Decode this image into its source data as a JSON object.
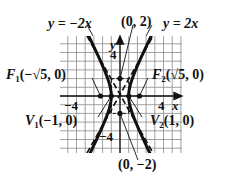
{
  "diagram": {
    "type": "hyperbola-graph",
    "equation_implied": "x^2 - y^2/4 = 1",
    "labels": {
      "asymptote_left": "y = −2x",
      "asymptote_right": "y = 2x",
      "covertex_top": "(0, 2)",
      "covertex_bottom": "(0, −2)",
      "focus_left_name": "F",
      "focus_left_sub": "1",
      "focus_left_coords": "(−√5, 0)",
      "focus_right_name": "F",
      "focus_right_sub": "2",
      "focus_right_coords": "(√5, 0)",
      "vertex_left_name": "V",
      "vertex_left_sub": "1",
      "vertex_left_coords": "(−1, 0)",
      "vertex_right_name": "V",
      "vertex_right_sub": "2",
      "vertex_right_coords": "(1, 0)"
    },
    "axes": {
      "x_label": "x",
      "y_label": "y",
      "tick_x_neg": "−4",
      "tick_x_pos": "4",
      "tick_y_pos": "4",
      "tick_y_neg": "−4"
    },
    "points": [
      {
        "name": "F1",
        "x": -2.236,
        "y": 0
      },
      {
        "name": "V1",
        "x": -1,
        "y": 0
      },
      {
        "name": "V2",
        "x": 1,
        "y": 0
      },
      {
        "name": "F2",
        "x": 2.236,
        "y": 0
      },
      {
        "name": "B1",
        "x": 0,
        "y": 2
      },
      {
        "name": "B2",
        "x": 0,
        "y": -2
      }
    ],
    "colors": {
      "ink": "#111111",
      "grid": "#888888"
    }
  }
}
